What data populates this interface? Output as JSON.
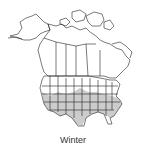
{
  "map": {
    "region": "North America",
    "season": "Winter",
    "range_fill_color": "#cccccc",
    "outline_color": "#222222",
    "background_color": "#ffffff",
    "shaded_region_description": "southern United States"
  },
  "caption": {
    "label": "Winter"
  }
}
